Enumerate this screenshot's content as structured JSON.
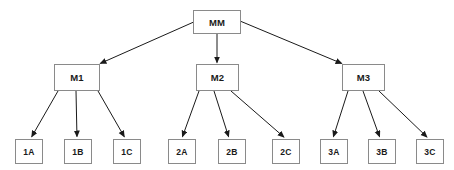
{
  "diagram": {
    "type": "org-tree",
    "background_color": "#ffffff",
    "node_border_color": "#8a8a8a",
    "node_fill_color": "#ffffff",
    "edge_color": "#1a1a1a",
    "text_color": "#1a1a1a",
    "nodes": [
      {
        "id": "MM",
        "label": "MM",
        "level": "root",
        "x": 193,
        "y": 10,
        "w": 48,
        "h": 24
      },
      {
        "id": "M1",
        "label": "M1",
        "level": "mid",
        "x": 54,
        "y": 64,
        "w": 46,
        "h": 27
      },
      {
        "id": "M2",
        "label": "M2",
        "level": "mid",
        "x": 196,
        "y": 64,
        "w": 43,
        "h": 27
      },
      {
        "id": "M3",
        "label": "M3",
        "level": "mid",
        "x": 342,
        "y": 64,
        "w": 43,
        "h": 27
      },
      {
        "id": "1A",
        "label": "1A",
        "level": "leaf",
        "x": 15,
        "y": 139,
        "w": 28,
        "h": 25
      },
      {
        "id": "1B",
        "label": "1B",
        "level": "leaf",
        "x": 64,
        "y": 139,
        "w": 28,
        "h": 25
      },
      {
        "id": "1C",
        "label": "1C",
        "level": "leaf",
        "x": 113,
        "y": 139,
        "w": 28,
        "h": 25
      },
      {
        "id": "2A",
        "label": "2A",
        "level": "leaf",
        "x": 168,
        "y": 139,
        "w": 28,
        "h": 25
      },
      {
        "id": "2B",
        "label": "2B",
        "level": "leaf",
        "x": 218,
        "y": 139,
        "w": 28,
        "h": 25
      },
      {
        "id": "2C",
        "label": "2C",
        "level": "leaf",
        "x": 272,
        "y": 139,
        "w": 28,
        "h": 25
      },
      {
        "id": "3A",
        "label": "3A",
        "level": "leaf",
        "x": 320,
        "y": 139,
        "w": 28,
        "h": 25
      },
      {
        "id": "3B",
        "label": "3B",
        "level": "leaf",
        "x": 368,
        "y": 139,
        "w": 28,
        "h": 25
      },
      {
        "id": "3C",
        "label": "3C",
        "level": "leaf",
        "x": 416,
        "y": 139,
        "w": 28,
        "h": 25
      }
    ],
    "edges": [
      {
        "from": "MM",
        "to": "M1",
        "x1": 196,
        "y1": 21,
        "x2": 99,
        "y2": 64
      },
      {
        "from": "MM",
        "to": "M2",
        "x1": 217,
        "y1": 34,
        "x2": 217,
        "y2": 64
      },
      {
        "from": "MM",
        "to": "M3",
        "x1": 240,
        "y1": 21,
        "x2": 343,
        "y2": 64
      },
      {
        "from": "M1",
        "to": "1A",
        "x1": 58,
        "y1": 91,
        "x2": 31,
        "y2": 138
      },
      {
        "from": "M1",
        "to": "1B",
        "x1": 76,
        "y1": 91,
        "x2": 77,
        "y2": 138
      },
      {
        "from": "M1",
        "to": "1C",
        "x1": 98,
        "y1": 91,
        "x2": 125,
        "y2": 138
      },
      {
        "from": "M2",
        "to": "2A",
        "x1": 199,
        "y1": 91,
        "x2": 182,
        "y2": 138
      },
      {
        "from": "M2",
        "to": "2B",
        "x1": 214,
        "y1": 91,
        "x2": 229,
        "y2": 138
      },
      {
        "from": "M2",
        "to": "2C",
        "x1": 231,
        "y1": 91,
        "x2": 285,
        "y2": 138
      },
      {
        "from": "M3",
        "to": "3A",
        "x1": 348,
        "y1": 91,
        "x2": 333,
        "y2": 138
      },
      {
        "from": "M3",
        "to": "3B",
        "x1": 363,
        "y1": 91,
        "x2": 380,
        "y2": 138
      },
      {
        "from": "M3",
        "to": "3C",
        "x1": 379,
        "y1": 91,
        "x2": 428,
        "y2": 138
      }
    ]
  }
}
